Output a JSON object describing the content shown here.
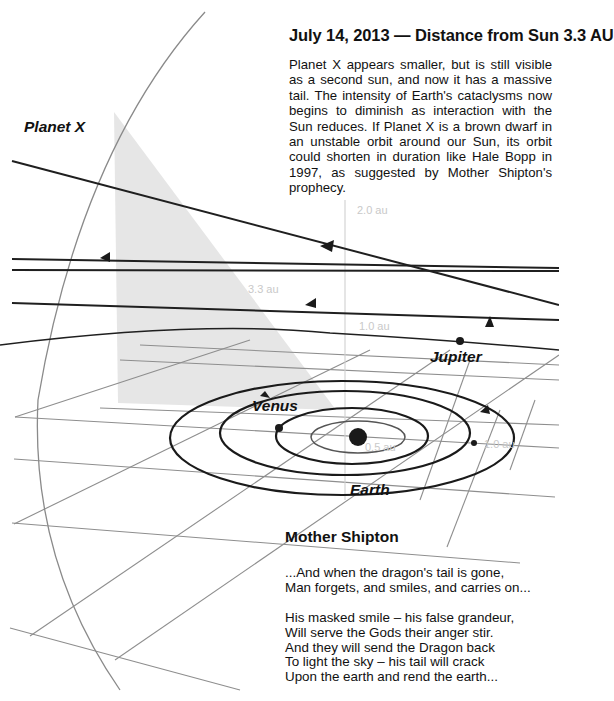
{
  "header": {
    "title": "July 14, 2013 — Distance from Sun 3.3 AU"
  },
  "diagram": {
    "labels": {
      "planet_x": "Planet X",
      "jupiter": "Jupiter",
      "venus": "Venus",
      "earth": "Earth"
    },
    "scale_markers": {
      "au_2_0": "2.0 au",
      "au_3_3": "3.3 au",
      "au_1_0_vertical": "1.0 au",
      "au_1_0_plane": "1.0 au",
      "au_0_5": "0.5 au"
    },
    "colors": {
      "orbit": "#1a1a1a",
      "grid": "#8a8a8a",
      "shadow": "#e4e4e4",
      "marker": "#c9c9c9"
    }
  },
  "poem": {
    "title": "Mother Shipton",
    "stanza_1": "...And when the dragon's tail is gone,\nMan forgets, and smiles, and carries on...",
    "stanza_2": "His masked smile – his false grandeur,\nWill serve the Gods their anger stir.\nAnd they will send the Dragon back\nTo light the sky – his tail will crack\nUpon the earth and rend the earth..."
  }
}
